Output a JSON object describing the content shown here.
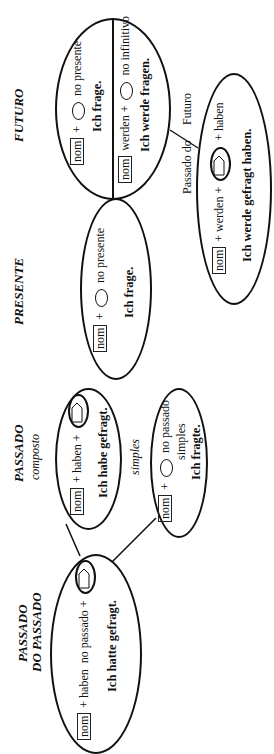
{
  "diagram": {
    "orientation": "rotated-90-ccw",
    "tenses": {
      "futuro": {
        "heading": "FUTURO",
        "row1": {
          "nom": "nom",
          "plus": "+",
          "suffix": "no presente",
          "example": "Ich frage."
        },
        "row2": {
          "nom": "nom",
          "aux": "werden +",
          "suffix": "no infinitivo",
          "example": "Ich werde fragen."
        }
      },
      "presente": {
        "heading": "PRESENTE",
        "formula": {
          "nom": "nom",
          "plus": "+",
          "suffix": "no presente"
        },
        "example": "Ich frage."
      },
      "passado_do_futuro": {
        "label_left": "Passado do",
        "label_right": "Futuro",
        "formula": {
          "nom": "nom",
          "aux": "+ werden +",
          "suffix": "+ haben"
        },
        "example": "Ich werde gefragt haben."
      },
      "passado": {
        "heading": "PASSADO",
        "composto": {
          "label": "composto",
          "formula": {
            "nom": "nom",
            "aux": "+ haben +"
          },
          "example": "Ich habe gefragt."
        },
        "simples": {
          "label": "simples",
          "formula": {
            "nom": "nom",
            "plus": "+",
            "suffix": "no passado",
            "suffix2": "simples"
          },
          "example": "Ich fragte."
        }
      },
      "passado_do_passado": {
        "heading_line1": "PASSADO",
        "heading_line2": "DO PASSADO",
        "formula": {
          "nom": "nom",
          "aux": "+ haben  no passado +"
        },
        "example": "Ich hatte gefragt."
      }
    }
  }
}
